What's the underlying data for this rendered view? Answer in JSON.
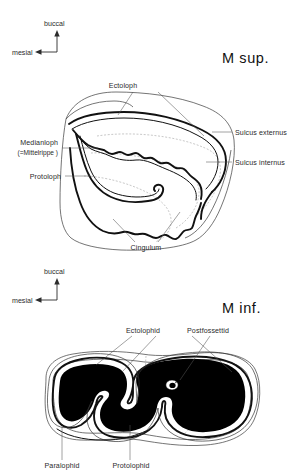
{
  "figure": {
    "background_color": "#ffffff",
    "ink_color": "#111111",
    "leader_color": "#555555",
    "dentine_fill": "#000000"
  },
  "upper": {
    "title": "M sup.",
    "orientation": {
      "vertical_label": "buccal",
      "horizontal_label": "mesial",
      "vertical_arrow": "arrow-up-icon",
      "horizontal_arrow": "arrow-left-icon"
    },
    "labels": {
      "ectoloph": "Ectoloph",
      "sulcus_externus": "Sulcus externus",
      "sulcus_internus": "Sulcus internus",
      "medianloph": "Medianloph",
      "medianloph_alt": "(=Mittelrippe )",
      "protoloph": "Protoloph",
      "cingulum": "Cingulum"
    }
  },
  "lower": {
    "title": "M inf.",
    "orientation": {
      "vertical_label": "buccal",
      "horizontal_label": "mesial",
      "vertical_arrow": "arrow-up-icon",
      "horizontal_arrow": "arrow-left-icon"
    },
    "labels": {
      "ectolophid": "Ectolophid",
      "postfossettid": "Postfossettid",
      "paralophid": "Paralophid",
      "protolophid": "Protolophid"
    }
  }
}
